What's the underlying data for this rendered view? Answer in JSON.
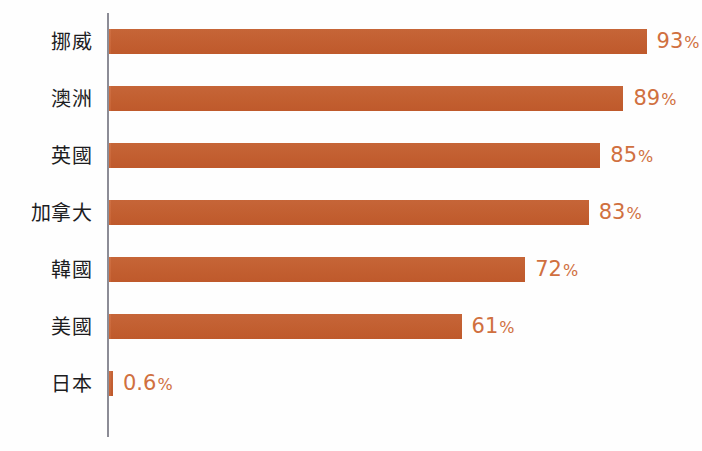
{
  "chart_data": {
    "type": "bar",
    "orientation": "horizontal",
    "title": "",
    "subtitle": "",
    "xlabel": "",
    "ylabel": "",
    "categories": [
      "挪威",
      "澳洲",
      "英國",
      "加拿大",
      "韓國",
      "美國",
      "日本"
    ],
    "values": [
      93,
      89,
      85,
      83,
      72,
      61,
      0.6
    ],
    "value_labels": [
      "93",
      "89",
      "85",
      "83",
      "72",
      "61",
      "0.6"
    ],
    "unit_symbol": "%",
    "xlim": [
      0,
      100
    ],
    "grid": false,
    "legend": false,
    "series": [
      {
        "name": "",
        "values": [
          93,
          89,
          85,
          83,
          72,
          61,
          0.6
        ]
      }
    ]
  },
  "style": {
    "bar_color": "#c9602f",
    "value_label_color": "#d0703f",
    "category_label_color": "#1d1d1f",
    "axis_color": "#8c8c96",
    "background_color": "#fefefe"
  },
  "bars": [
    {
      "label": "挪威",
      "value": "93",
      "unit": "%"
    },
    {
      "label": "澳洲",
      "value": "89",
      "unit": "%"
    },
    {
      "label": "英國",
      "value": "85",
      "unit": "%"
    },
    {
      "label": "加拿大",
      "value": "83",
      "unit": "%"
    },
    {
      "label": "韓國",
      "value": "72",
      "unit": "%"
    },
    {
      "label": "美國",
      "value": "61",
      "unit": "%"
    },
    {
      "label": "日本",
      "value": "0.6",
      "unit": "%"
    }
  ]
}
